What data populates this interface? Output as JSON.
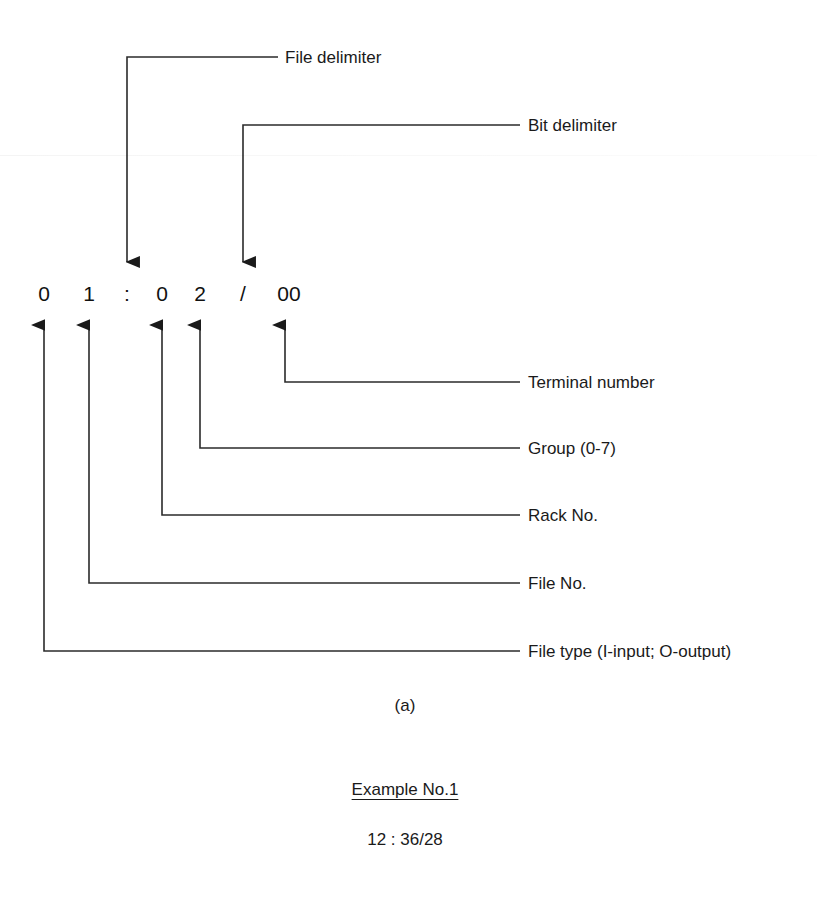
{
  "figure": {
    "address_string": "01:02/00",
    "address_chars": [
      {
        "id": "file-type-digit",
        "text": "0",
        "x": 44
      },
      {
        "id": "file-no-digit",
        "text": "1",
        "x": 89
      },
      {
        "id": "file-delimiter",
        "text": ":",
        "x": 127
      },
      {
        "id": "rack-no-digit",
        "text": "0",
        "x": 162
      },
      {
        "id": "group-digit",
        "text": "2",
        "x": 200
      },
      {
        "id": "bit-delimiter",
        "text": "/",
        "x": 243
      },
      {
        "id": "terminal-digits",
        "text": "00",
        "x": 289
      }
    ],
    "top_callouts": [
      {
        "id": "file-delimiter",
        "label": "File delimiter",
        "stem_x": 127,
        "line_y": 57,
        "label_x": 285
      },
      {
        "id": "bit-delimiter",
        "label": "Bit delimiter",
        "stem_x": 243,
        "line_y": 125,
        "label_x": 528
      }
    ],
    "bottom_callouts": [
      {
        "id": "terminal-number",
        "label": "Terminal number",
        "stem_x": 285,
        "line_y": 382
      },
      {
        "id": "group",
        "label": "Group (0-7)",
        "stem_x": 200,
        "line_y": 448
      },
      {
        "id": "rack-no",
        "label": "Rack No.",
        "stem_x": 162,
        "line_y": 515
      },
      {
        "id": "file-no",
        "label": "File No.",
        "stem_x": 89,
        "line_y": 583
      },
      {
        "id": "file-type",
        "label": "File type (I-input; O-output)",
        "stem_x": 44,
        "line_y": 651
      }
    ],
    "label_x": 528,
    "figure_label": "(a)",
    "example_heading": "Example No.1",
    "example_value": "12 : 36/28",
    "colors": {
      "ink": "#1a1a1a",
      "line": "#2b2b2b",
      "background": "#ffffff"
    }
  }
}
